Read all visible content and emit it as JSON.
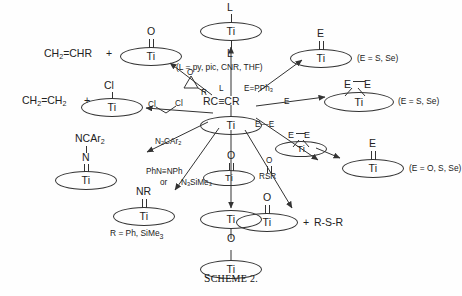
{
  "figure": {
    "caption_small_caps": "S",
    "caption_rest": "CHEME",
    "caption_number": "2.",
    "caption_full": "SCHEME 2."
  },
  "center": {
    "fragment_label": "RC≡CR",
    "metal": "Ti"
  },
  "products": {
    "top_center": {
      "ligand_top": "L",
      "ligand_bottom": "L",
      "metal": "Ti",
      "note": "(L = py, pic, CNR, THF)"
    },
    "top_right": {
      "substituent": "E",
      "metal": "Ti",
      "note": "(E = S, Se)"
    },
    "mid_right": {
      "substituent_left": "E",
      "substituent_right": "E",
      "metal": "Ti",
      "note": "(E = S, Se)"
    },
    "lower_right": {
      "substituent": "E",
      "metal": "Ti",
      "note": "(E = O, S, Se)"
    },
    "far_right_ring": {
      "substituent_left": "E",
      "substituent_right": "E",
      "metal": "Ti"
    },
    "top_left": {
      "organic": "CH₂=CHR",
      "plus": "+",
      "substituent": "O",
      "metal": "Ti"
    },
    "mid_left": {
      "organic": "CH₂=CH₂",
      "plus": "+",
      "substituent": "Cl",
      "metal": "Ti"
    },
    "imido_diaryl": {
      "substituent_top": "NCAr₂",
      "substituent_mid": "N",
      "metal": "Ti"
    },
    "imido_nr": {
      "substituent": "NR",
      "metal": "Ti",
      "note": "R = Ph, SiMe₃"
    },
    "oxo_dimer": {
      "metal_top": "Ti",
      "bridge": "O",
      "metal_bottom": "Ti"
    },
    "oxo_center": {
      "substituent": "O",
      "metal": "Ti"
    },
    "oxo_with_sulfide": {
      "substituent": "O",
      "metal": "Ti",
      "plus": "+",
      "organic": "R-S-R"
    }
  },
  "reagents": {
    "ligand_L": "L",
    "chalcogen_phosphine": "E=PPh₃",
    "chalcogen_E": "E",
    "dichalcogenide": "E—E",
    "epoxide_substituent": "R",
    "epoxide_oxygen": "O",
    "dichloroethane_left": "Cl",
    "dichloroethane_right": "Cl",
    "diazoalkane": "N₂CAr₂",
    "azobenzene": "PhN≡NPh",
    "or_word": "or",
    "azidosilane": "N₃SiMe₃",
    "sulfoxide_o": "O",
    "sulfoxide_s": "RSR",
    "oxo_reagent_o": "O"
  },
  "colors": {
    "ink": "#222222",
    "line": "#333333",
    "background": "#fefefe"
  }
}
